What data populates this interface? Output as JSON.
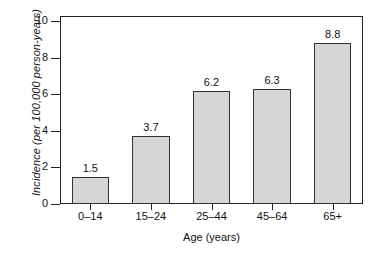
{
  "chart_data": {
    "type": "bar",
    "title": "",
    "subtitle": "",
    "xlabel": "Age (years)",
    "ylabel": "Incidence (per 100,000 person-years)",
    "categories": [
      "0–14",
      "15–24",
      "25–44",
      "45–64",
      "65+"
    ],
    "values": [
      1.5,
      3.7,
      6.2,
      6.3,
      8.8
    ],
    "value_labels": [
      "1.5",
      "3.7",
      "6.2",
      "6.3",
      "8.8"
    ],
    "ylim": [
      0,
      10
    ],
    "yticks": [
      0,
      2,
      4,
      6,
      8,
      10
    ],
    "ytick_labels": [
      "0",
      "2",
      "4",
      "6",
      "8",
      "10"
    ],
    "grid": false,
    "legend": false,
    "legend_position": "none",
    "bar_fill_color": "#d6d6d6",
    "bar_edge_color": "#333333",
    "axis_color": "#222222",
    "background_color": "#ffffff"
  }
}
